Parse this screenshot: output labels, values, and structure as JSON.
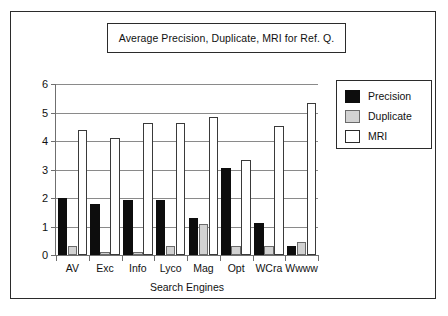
{
  "chart_data": {
    "type": "bar",
    "title": "Average Precision, Duplicate, MRI for Ref. Q.",
    "xlabel": "Search Engines",
    "ylabel": "",
    "categories": [
      "AV",
      "Exc",
      "Info",
      "Lyco",
      "Mag",
      "Opt",
      "WCra",
      "Wwww"
    ],
    "series": [
      {
        "name": "Precision",
        "color": "#0d0d0d",
        "values": [
          2.0,
          1.8,
          1.92,
          1.92,
          1.3,
          3.05,
          1.12,
          0.33
        ]
      },
      {
        "name": "Duplicate",
        "color": "#d2d2d2",
        "values": [
          0.3,
          0.12,
          0.12,
          0.33,
          1.08,
          0.33,
          0.33,
          0.45
        ]
      },
      {
        "name": "MRI",
        "color": "#ffffff",
        "values": [
          4.4,
          4.12,
          4.62,
          4.62,
          4.83,
          3.35,
          4.53,
          5.35
        ]
      }
    ],
    "ylim": [
      0,
      6
    ],
    "yticks": [
      0,
      1,
      2,
      3,
      4,
      5,
      6
    ],
    "ytick_labels": [
      "0",
      "1",
      "2",
      "3",
      "4",
      "5",
      "6"
    ],
    "grid": true,
    "legend_position": "right"
  }
}
